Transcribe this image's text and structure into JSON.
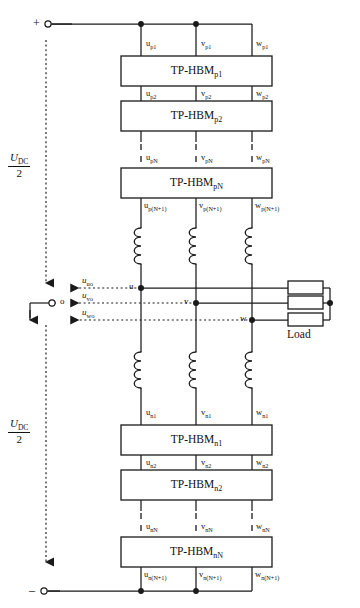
{
  "figure": {
    "type": "circuit-schematic"
  },
  "terminals": {
    "positive": "+",
    "negative": "–",
    "midpoint": "o"
  },
  "dc_source": {
    "upper": {
      "numerator": "U",
      "numerator_sub": "DC",
      "denominator": "2"
    },
    "lower": {
      "numerator": "U",
      "numerator_sub": "DC",
      "denominator": "2"
    }
  },
  "phase_nodes": {
    "u": "u",
    "v": "v",
    "w": "w"
  },
  "output_voltages": [
    {
      "symbol": "u",
      "sub": "uo"
    },
    {
      "symbol": "u",
      "sub": "vo"
    },
    {
      "symbol": "u",
      "sub": "wo"
    }
  ],
  "load": {
    "label": "Load",
    "elements": 3
  },
  "modules": {
    "positive_arm": [
      {
        "name": "TP-HBM",
        "name_sub": "p1",
        "top_ports": [
          {
            "s": "u",
            "sub": "p1"
          },
          {
            "s": "v",
            "sub": "p1"
          },
          {
            "s": "w",
            "sub": "p1"
          }
        ],
        "bottom_ports": [
          {
            "s": "u",
            "sub": "p2"
          },
          {
            "s": "v",
            "sub": "p2"
          },
          {
            "s": "w",
            "sub": "p2"
          }
        ]
      },
      {
        "name": "TP-HBM",
        "name_sub": "p2",
        "top_ports": [
          {
            "s": "u",
            "sub": "p2"
          },
          {
            "s": "v",
            "sub": "p2"
          },
          {
            "s": "w",
            "sub": "p2"
          }
        ],
        "bottom_ports": [
          {
            "s": "u",
            "sub": "pN"
          },
          {
            "s": "v",
            "sub": "pN"
          },
          {
            "s": "w",
            "sub": "pN"
          }
        ]
      },
      {
        "name": "TP-HBM",
        "name_sub": "pN",
        "top_ports": [
          {
            "s": "u",
            "sub": "pN"
          },
          {
            "s": "v",
            "sub": "pN"
          },
          {
            "s": "w",
            "sub": "pN"
          }
        ],
        "bottom_ports": [
          {
            "s": "u",
            "sub": "p(N+1)"
          },
          {
            "s": "v",
            "sub": "p(N+1)"
          },
          {
            "s": "w",
            "sub": "p(N+1)"
          }
        ]
      }
    ],
    "negative_arm": [
      {
        "name": "TP-HBM",
        "name_sub": "n1",
        "top_ports": [
          {
            "s": "u",
            "sub": "n1"
          },
          {
            "s": "v",
            "sub": "n1"
          },
          {
            "s": "w",
            "sub": "n1"
          }
        ],
        "bottom_ports": [
          {
            "s": "u",
            "sub": "n2"
          },
          {
            "s": "v",
            "sub": "n2"
          },
          {
            "s": "w",
            "sub": "n2"
          }
        ]
      },
      {
        "name": "TP-HBM",
        "name_sub": "n2",
        "top_ports": [
          {
            "s": "u",
            "sub": "n2"
          },
          {
            "s": "v",
            "sub": "n2"
          },
          {
            "s": "w",
            "sub": "n2"
          }
        ],
        "bottom_ports": [
          {
            "s": "u",
            "sub": "nN"
          },
          {
            "s": "v",
            "sub": "nN"
          },
          {
            "s": "w",
            "sub": "nN"
          }
        ]
      },
      {
        "name": "TP-HBM",
        "name_sub": "nN",
        "top_ports": [
          {
            "s": "u",
            "sub": "nN"
          },
          {
            "s": "v",
            "sub": "nN"
          },
          {
            "s": "w",
            "sub": "nN"
          }
        ],
        "bottom_ports": [
          {
            "s": "u",
            "sub": "n(N+1)"
          },
          {
            "s": "v",
            "sub": "n(N+1)"
          },
          {
            "s": "w",
            "sub": "n(N+1)"
          }
        ]
      }
    ]
  },
  "colors": {
    "line": "#1a1a1a",
    "text": "#111111",
    "background": "#ffffff"
  }
}
